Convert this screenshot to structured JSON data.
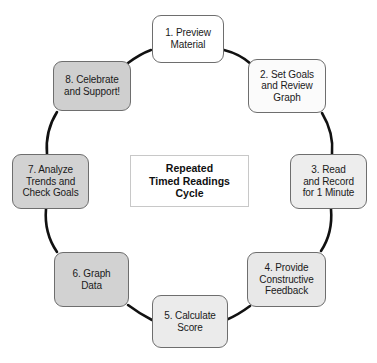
{
  "diagram": {
    "center": {
      "text": "Repeated\nTimed Readings\nCycle",
      "fill": "#ffffff",
      "border": "#c8c8c8"
    },
    "canvas": {
      "width": 377,
      "height": 363,
      "background": "#ffffff"
    },
    "connector": {
      "color": "#111111",
      "width": 2.6,
      "style": "curved-arc",
      "arrowheads": "none"
    },
    "nodes": [
      {
        "id": "step-1",
        "number": "1",
        "text": "1. Preview\nMaterial",
        "fill": "#ffffff",
        "border": "#6e6e6e",
        "x": 152,
        "y": 15,
        "w": 72,
        "h": 48
      },
      {
        "id": "step-2",
        "number": "2",
        "text": "2. Set Goals\nand Review\nGraph",
        "fill": "#fbfbfb",
        "border": "#6e6e6e",
        "x": 248,
        "y": 59,
        "w": 78,
        "h": 54
      },
      {
        "id": "step-3",
        "number": "3",
        "text": "3. Read\nand Record\nfor 1 Minute",
        "fill": "#ededed",
        "border": "#6e6e6e",
        "x": 290,
        "y": 154,
        "w": 77,
        "h": 55
      },
      {
        "id": "step-4",
        "number": "4",
        "text": "4. Provide\nConstructive\nFeedback",
        "fill": "#e8e8e8",
        "border": "#6e6e6e",
        "x": 247,
        "y": 252,
        "w": 79,
        "h": 55
      },
      {
        "id": "step-5",
        "number": "5",
        "text": "5. Calculate\nScore",
        "fill": "#ebebeb",
        "border": "#6e6e6e",
        "x": 152,
        "y": 295,
        "w": 76,
        "h": 53
      },
      {
        "id": "step-6",
        "number": "6",
        "text": "6. Graph\nData",
        "fill": "#d2d2d2",
        "border": "#6e6e6e",
        "x": 54,
        "y": 252,
        "w": 75,
        "h": 55
      },
      {
        "id": "step-7",
        "number": "7",
        "text": "7. Analyze\nTrends and\nCheck Goals",
        "fill": "#d2d2d2",
        "border": "#6e6e6e",
        "x": 12,
        "y": 154,
        "w": 77,
        "h": 55
      },
      {
        "id": "step-8",
        "number": "8",
        "text": "8. Celebrate\nand Support!",
        "fill": "#cfcfcf",
        "border": "#6e6e6e",
        "x": 53,
        "y": 61,
        "w": 78,
        "h": 50
      }
    ],
    "arcs": [
      {
        "from": "step-1",
        "to": "step-2",
        "d": "M 224 50 Q 240 54 251 64"
      },
      {
        "from": "step-2",
        "to": "step-3",
        "d": "M 322 113 Q 334 133 332 154"
      },
      {
        "from": "step-3",
        "to": "step-4",
        "d": "M 331 209 Q 333 233 321 251"
      },
      {
        "from": "step-4",
        "to": "step-5",
        "d": "M 250 306 Q 238 315 226 320"
      },
      {
        "from": "step-5",
        "to": "step-6",
        "d": "M 152 320 Q 140 314 128 305"
      },
      {
        "from": "step-6",
        "to": "step-7",
        "d": "M 57 252 Q 44 233 46 209"
      },
      {
        "from": "step-7",
        "to": "step-8",
        "d": "M 47 154 Q 45 131 57 112"
      },
      {
        "from": "step-8",
        "to": "step-1",
        "d": "M 128 63 Q 140 54 151 50"
      }
    ]
  }
}
